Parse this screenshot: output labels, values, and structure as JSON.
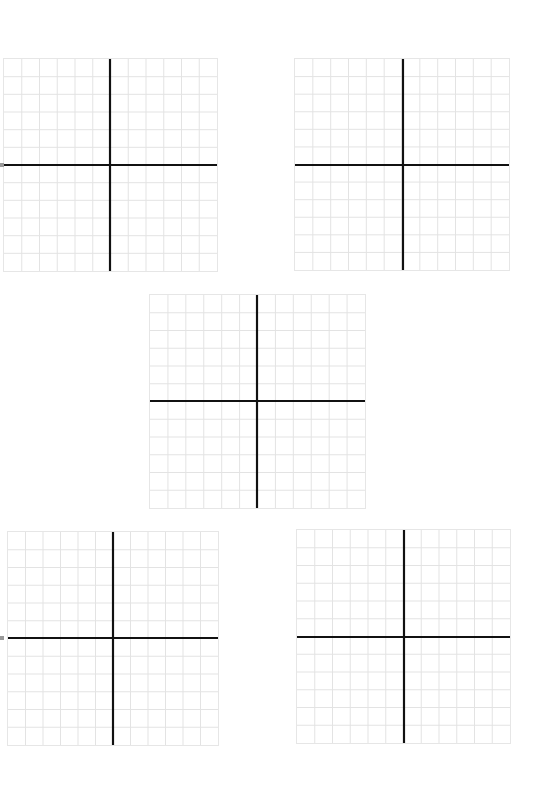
{
  "page": {
    "background": "#ffffff",
    "width": 543,
    "height": 808
  },
  "style": {
    "gridline_color": "#e3e3e3",
    "axis_color": "#111111",
    "axis_width": 2.2,
    "gridline_width": 1
  },
  "grids": [
    {
      "id": "grid-top-left",
      "x": 3,
      "y": 58,
      "w": 215,
      "h": 214,
      "cells": 12,
      "axis_x": 107,
      "axis_y": 107
    },
    {
      "id": "grid-top-right",
      "x": 294,
      "y": 58,
      "w": 216,
      "h": 213,
      "cells": 12,
      "axis_x": 109,
      "axis_y": 107
    },
    {
      "id": "grid-center",
      "x": 149,
      "y": 294,
      "w": 217,
      "h": 215,
      "cells": 12,
      "axis_x": 108,
      "axis_y": 107
    },
    {
      "id": "grid-bottom-left",
      "x": 7,
      "y": 531,
      "w": 212,
      "h": 215,
      "cells": 12,
      "axis_x": 106,
      "axis_y": 107
    },
    {
      "id": "grid-bottom-right",
      "x": 296,
      "y": 529,
      "w": 215,
      "h": 215,
      "cells": 12,
      "axis_x": 108,
      "axis_y": 108
    }
  ],
  "edge_marks": [
    {
      "x": 0,
      "y": 163
    },
    {
      "x": 0,
      "y": 636
    }
  ]
}
